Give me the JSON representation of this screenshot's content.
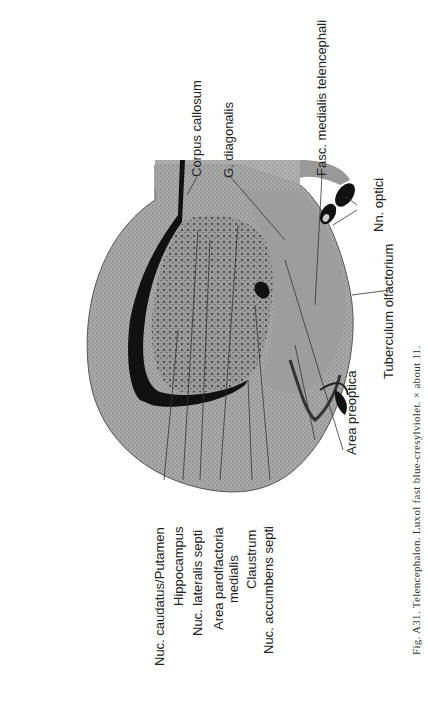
{
  "figure": {
    "caption": "Fig. A31.   Telencephalon. Luxol fast blue-cresylviolet. × about 11.",
    "labels": {
      "corpus_callosum": "Corpus callosum",
      "g_diagonalis": "G. diagonalis",
      "fasc_medialis": "Fasc. medialis telencephali",
      "nn_optici": "Nn. optici",
      "tuberculum": "Tuberculum olfactorium",
      "area_preoptica": "Area preoptica",
      "tr_tuberculo": "Tr. tuberculopyriformis",
      "nuc_accumbens": "Nuc. accumbens septi",
      "claustrum": "Claustrum",
      "area_parolf_1": "Area parolfactoria",
      "area_parolf_2": "medialis",
      "nuc_lateralis": "Nuc. lateralis septi",
      "hippocampus": "Hippocampus",
      "nuc_caudatus": "Nuc. caudatus/Putamen"
    },
    "stain_colors": {
      "tissue": "#8a8a8a",
      "dark": "#111111",
      "paper": "#ffffff"
    }
  }
}
